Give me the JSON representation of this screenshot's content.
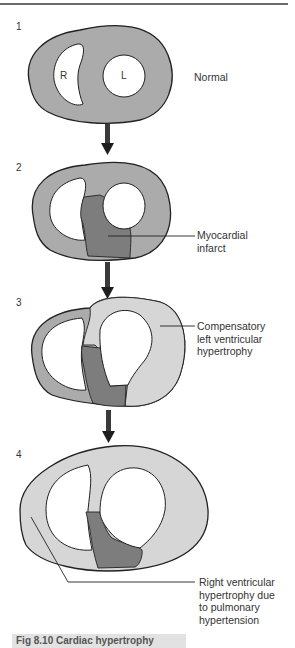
{
  "colors": {
    "myocardium_normal": "#ababab",
    "myocardium_hypertrophy": "#d6d6d6",
    "infarct": "#7d7d7d",
    "outline": "#222222",
    "arrow": "#3a3a3a"
  },
  "stages": [
    {
      "number": "1",
      "label": "Normal",
      "chambers": {
        "right": "R",
        "left": "L"
      }
    },
    {
      "number": "2",
      "label_lines": [
        "Myocardial",
        "infarct"
      ]
    },
    {
      "number": "3",
      "label_lines": [
        "Compensatory",
        "left ventricular",
        "hypertrophy"
      ]
    },
    {
      "number": "4",
      "label_lines": [
        "Right ventricular",
        "hypertrophy due",
        "to pulmonary",
        "hypertension"
      ]
    }
  ],
  "caption": "Fig 8.10 Cardiac hypertrophy"
}
